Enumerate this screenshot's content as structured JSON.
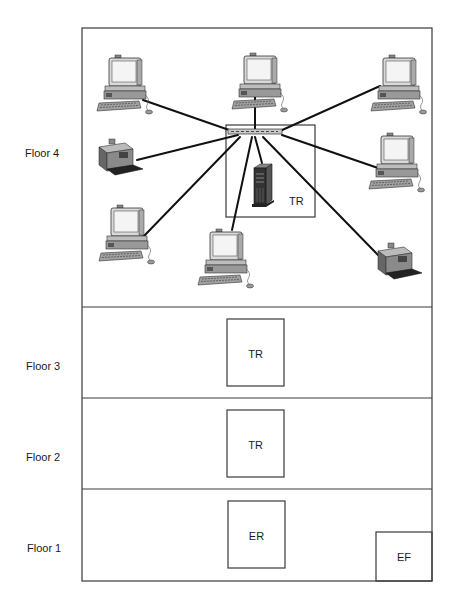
{
  "floors": [
    {
      "label": "Floor 4",
      "rooms": [
        {
          "label": "TR"
        }
      ]
    },
    {
      "label": "Floor 3",
      "rooms": [
        {
          "label": "TR"
        }
      ]
    },
    {
      "label": "Floor 2",
      "rooms": [
        {
          "label": "TR"
        }
      ]
    },
    {
      "label": "Floor 1",
      "rooms": [
        {
          "label": "ER"
        },
        {
          "label": "EF"
        }
      ]
    }
  ],
  "floor4_devices": [
    {
      "type": "workstation",
      "position": "top-left"
    },
    {
      "type": "workstation",
      "position": "top-center"
    },
    {
      "type": "workstation",
      "position": "top-right"
    },
    {
      "type": "printer",
      "position": "middle-left"
    },
    {
      "type": "workstation",
      "position": "middle-right"
    },
    {
      "type": "workstation",
      "position": "bottom-left"
    },
    {
      "type": "workstation",
      "position": "bottom-center"
    },
    {
      "type": "printer",
      "position": "bottom-right"
    },
    {
      "type": "server",
      "position": "in-telecom-room"
    }
  ],
  "hub": {
    "type": "switch",
    "location": "Floor 4 TR"
  },
  "colors": {
    "line": "#111111",
    "wall": "#3a3a3a",
    "background": "#ffffff"
  }
}
